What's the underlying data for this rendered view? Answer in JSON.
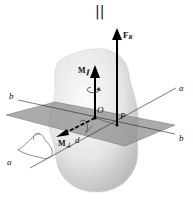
{
  "figure": {
    "top_symbol": "||",
    "labels": {
      "resultant_force": "F",
      "resultant_force_sub": "R",
      "moment_parallel": "M",
      "moment_parallel_sub": "∥",
      "moment_perp": "M",
      "moment_perp_sub": "⊥",
      "origin": "O",
      "point_p": "P",
      "distance": "d",
      "axis_a_upper": "a",
      "axis_a_lower": "a",
      "axis_b_left": "b",
      "axis_b_right": "b"
    },
    "colors": {
      "body": "#e8e8e8",
      "plane": "#9a9a9a",
      "lines": "#111111"
    }
  }
}
